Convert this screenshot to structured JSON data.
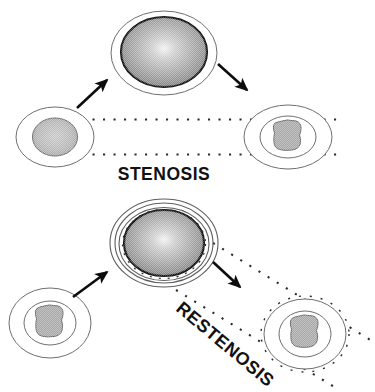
{
  "diagram": {
    "background_color": "#ffffff",
    "width": 375,
    "height": 392,
    "labels": {
      "stenosis": "STENOSIS",
      "restenosis": "RESTENOSIS"
    },
    "label_styles": {
      "stenosis_rotation_deg": 0,
      "restenosis_rotation_deg": 40,
      "color": "#111111"
    },
    "rows": [
      {
        "name": "stenosis-row",
        "label": "STENOSIS",
        "stages": [
          {
            "name": "stenosis-stage-before",
            "position": "left",
            "description": "vessel with single outline and large round gray plaque",
            "rings": 1,
            "plaque_shape": "round",
            "plaque_color": "#b4b4b4"
          },
          {
            "name": "stenosis-stage-balloon",
            "position": "center",
            "description": "inflated angioplasty balloon inside vessel",
            "rings": 1,
            "plaque_shape": "balloon",
            "plaque_color": "#9b9b9b"
          },
          {
            "name": "stenosis-stage-after",
            "position": "right",
            "description": "vessel with two outlines and irregular gray plaque",
            "rings": 2,
            "plaque_shape": "irregular",
            "plaque_color": "#a8a8a8"
          }
        ],
        "arrows": [
          {
            "name": "arrow-up-right",
            "direction": "up-right"
          },
          {
            "name": "arrow-down-right",
            "direction": "down-right"
          }
        ],
        "guide_lines": {
          "name": "stenosis-guide-lines",
          "style": "dotted",
          "orientation": "horizontal",
          "count": 2
        }
      },
      {
        "name": "restenosis-row",
        "label": "RESTENOSIS",
        "stages": [
          {
            "name": "restenosis-stage-before",
            "position": "left",
            "description": "vessel with two outlines and irregular gray plaque",
            "rings": 2,
            "plaque_shape": "irregular",
            "plaque_color": "#a8a8a8"
          },
          {
            "name": "restenosis-stage-stent",
            "position": "center",
            "description": "expanded stent rings around inflated balloon",
            "rings": 4,
            "plaque_shape": "balloon",
            "plaque_color": "#9b9b9b"
          },
          {
            "name": "restenosis-stage-after",
            "position": "right",
            "description": "vessel with two outlines and irregular gray plaque regrown",
            "rings": 2,
            "plaque_shape": "irregular",
            "plaque_color": "#a8a8a8"
          }
        ],
        "arrows": [
          {
            "name": "arrow-up-right",
            "direction": "up-right"
          },
          {
            "name": "arrow-down-right",
            "direction": "down-right"
          }
        ],
        "guide_lines": {
          "name": "restenosis-guide-lines",
          "style": "dotted",
          "orientation": "diagonal",
          "count": 2
        }
      }
    ]
  }
}
